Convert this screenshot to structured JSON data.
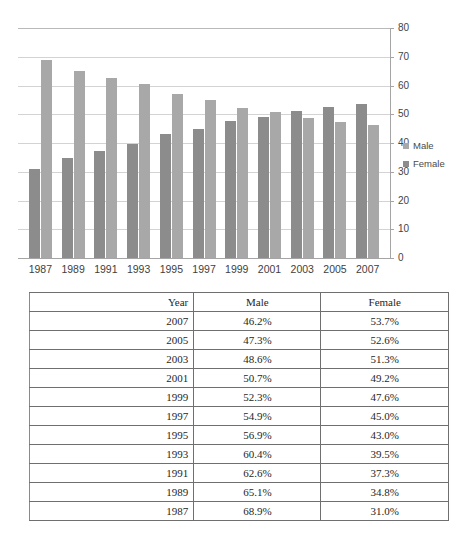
{
  "chart_data": {
    "type": "bar",
    "title": "",
    "subtitle": "",
    "xlabel": "",
    "ylabel": "",
    "ylim": [
      0,
      80
    ],
    "ytick_step": 10,
    "yticks": [
      80,
      70,
      60,
      50,
      40,
      30,
      20,
      10,
      0
    ],
    "grid": true,
    "legend_position": "right",
    "categories": [
      "1987",
      "1989",
      "1991",
      "1993",
      "1995",
      "1997",
      "1999",
      "2001",
      "2003",
      "2005",
      "2007"
    ],
    "series": [
      {
        "name": "Male",
        "color": "#a8a8a8",
        "values": [
          68.9,
          65.1,
          62.6,
          60.4,
          56.9,
          54.9,
          52.3,
          50.7,
          48.6,
          47.3,
          46.2
        ]
      },
      {
        "name": "Female",
        "color": "#8c8c8c",
        "values": [
          31.0,
          34.8,
          37.3,
          39.5,
          43.0,
          45.0,
          47.6,
          49.2,
          51.3,
          52.6,
          53.7
        ]
      }
    ],
    "bar_draw_order": [
      "Female",
      "Male"
    ]
  },
  "legend": {
    "items": [
      {
        "label": "Male",
        "swatch_class": "sw-male",
        "color": "#a8a8a8"
      },
      {
        "label": "Female",
        "swatch_class": "sw-female",
        "color": "#8c8c8c"
      }
    ]
  },
  "table": {
    "headers": [
      "Year",
      "Male",
      "Female"
    ],
    "rows": [
      {
        "year": "2007",
        "male": "46.2%",
        "female": "53.7%"
      },
      {
        "year": "2005",
        "male": "47.3%",
        "female": "52.6%"
      },
      {
        "year": "2003",
        "male": "48.6%",
        "female": "51.3%"
      },
      {
        "year": "2001",
        "male": "50.7%",
        "female": "49.2%"
      },
      {
        "year": "1999",
        "male": "52.3%",
        "female": "47.6%"
      },
      {
        "year": "1997",
        "male": "54.9%",
        "female": "45.0%"
      },
      {
        "year": "1995",
        "male": "56.9%",
        "female": "43.0%"
      },
      {
        "year": "1993",
        "male": "60.4%",
        "female": "39.5%"
      },
      {
        "year": "1991",
        "male": "62.6%",
        "female": "37.3%"
      },
      {
        "year": "1989",
        "male": "65.1%",
        "female": "34.8%"
      },
      {
        "year": "1987",
        "male": "68.9%",
        "female": "31.0%"
      }
    ]
  }
}
